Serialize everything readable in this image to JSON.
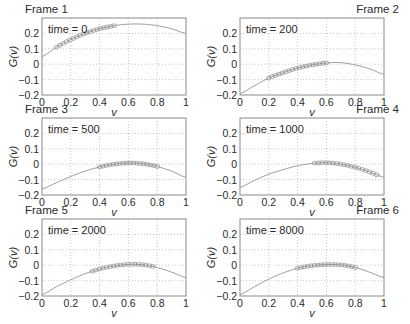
{
  "figure": {
    "title": "",
    "theme": {
      "text": "#2a2a2a",
      "box": "#8a8a8a",
      "grid": "#b8b8b8",
      "curve": "#9a9a9a",
      "marker": "#8a8a8a"
    }
  },
  "chart_data": [
    {
      "type": "line",
      "frame_label": "Frame 1",
      "frame_label_align": "left",
      "annotation": "time = 0",
      "xlabel": "v",
      "ylabel": "G(v)",
      "xlim": [
        0,
        1
      ],
      "ylim": [
        -0.2,
        0.3
      ],
      "xticks": [
        "0",
        "0.2",
        "0.4",
        "0.6",
        "0.8",
        "1"
      ],
      "yticks": [
        "0.2",
        "0.1",
        "0",
        "−0.1",
        "−0.2"
      ],
      "grid": true,
      "x": [
        0,
        0.1,
        0.2,
        0.3,
        0.4,
        0.5,
        0.6,
        0.7,
        0.8,
        0.9,
        1.0
      ],
      "series": [
        {
          "name": "G(v)",
          "values": [
            0.05,
            0.11,
            0.16,
            0.2,
            0.23,
            0.25,
            0.26,
            0.26,
            0.25,
            0.23,
            0.2
          ]
        }
      ],
      "markers": {
        "shape": "open-circle",
        "v_start": 0.1,
        "v_end": 0.5,
        "count": 18
      }
    },
    {
      "type": "line",
      "frame_label": "Frame 2",
      "frame_label_align": "right",
      "annotation": "time = 200",
      "xlabel": "v",
      "ylabel": "G(v)",
      "xlim": [
        0,
        1
      ],
      "ylim": [
        -0.2,
        0.3
      ],
      "xticks": [
        "0",
        "0.2",
        "0.4",
        "0.6",
        "0.8",
        "1"
      ],
      "yticks": [
        "0.2",
        "0.1",
        "0",
        "−0.1",
        "−0.2"
      ],
      "grid": true,
      "x": [
        0,
        0.1,
        0.2,
        0.3,
        0.4,
        0.5,
        0.6,
        0.7,
        0.8,
        0.9,
        1.0
      ],
      "series": [
        {
          "name": "G(v)",
          "values": [
            -0.19,
            -0.14,
            -0.09,
            -0.055,
            -0.025,
            -0.005,
            0.008,
            0.01,
            -0.005,
            -0.03,
            -0.065
          ]
        }
      ],
      "markers": {
        "shape": "open-circle",
        "v_start": 0.2,
        "v_end": 0.6,
        "count": 18
      }
    },
    {
      "type": "line",
      "frame_label": "Frame 3",
      "frame_label_align": "left",
      "annotation": "time = 500",
      "xlabel": "v",
      "ylabel": "G(v)",
      "xlim": [
        0,
        1
      ],
      "ylim": [
        -0.2,
        0.3
      ],
      "xticks": [
        "0",
        "0.2",
        "0.4",
        "0.6",
        "0.8",
        "1"
      ],
      "yticks": [
        "0.2",
        "0.1",
        "0",
        "−0.1",
        "−0.2"
      ],
      "grid": true,
      "x": [
        0,
        0.1,
        0.2,
        0.3,
        0.4,
        0.5,
        0.6,
        0.7,
        0.8,
        0.9,
        1.0
      ],
      "series": [
        {
          "name": "G(v)",
          "values": [
            -0.16,
            -0.12,
            -0.08,
            -0.045,
            -0.018,
            0.0,
            0.008,
            0.003,
            -0.015,
            -0.045,
            -0.085
          ]
        }
      ],
      "markers": {
        "shape": "open-circle",
        "v_start": 0.4,
        "v_end": 0.8,
        "count": 18
      }
    },
    {
      "type": "line",
      "frame_label": "Frame 4",
      "frame_label_align": "right",
      "annotation": "time = 1000",
      "xlabel": "v",
      "ylabel": "G(v)",
      "xlim": [
        0,
        1
      ],
      "ylim": [
        -0.2,
        0.3
      ],
      "xticks": [
        "0",
        "0.2",
        "0.4",
        "0.6",
        "0.8",
        "1"
      ],
      "yticks": [
        "0.2",
        "0.1",
        "0",
        "−0.1",
        "−0.2"
      ],
      "grid": true,
      "x": [
        0,
        0.1,
        0.2,
        0.3,
        0.4,
        0.5,
        0.6,
        0.7,
        0.8,
        0.9,
        1.0
      ],
      "series": [
        {
          "name": "G(v)",
          "values": [
            -0.15,
            -0.105,
            -0.065,
            -0.035,
            -0.01,
            0.005,
            0.01,
            0.0,
            -0.02,
            -0.05,
            -0.085
          ]
        }
      ],
      "markers": {
        "shape": "open-circle",
        "v_start": 0.52,
        "v_end": 0.95,
        "count": 18
      }
    },
    {
      "type": "line",
      "frame_label": "Frame 5",
      "frame_label_align": "left",
      "annotation": "time = 2000",
      "xlabel": "v",
      "ylabel": "G(v)",
      "xlim": [
        0,
        1
      ],
      "ylim": [
        -0.2,
        0.3
      ],
      "xticks": [
        "0",
        "0.2",
        "0.4",
        "0.6",
        "0.8",
        "1"
      ],
      "yticks": [
        "0.2",
        "0.1",
        "0",
        "−0.1",
        "−0.2"
      ],
      "grid": true,
      "x": [
        0,
        0.1,
        0.2,
        0.3,
        0.4,
        0.5,
        0.6,
        0.7,
        0.8,
        0.9,
        1.0
      ],
      "series": [
        {
          "name": "G(v)",
          "values": [
            -0.19,
            -0.14,
            -0.095,
            -0.055,
            -0.025,
            -0.005,
            0.005,
            0.003,
            -0.015,
            -0.045,
            -0.08
          ]
        }
      ],
      "markers": {
        "shape": "open-circle",
        "v_start": 0.35,
        "v_end": 0.77,
        "count": 18
      }
    },
    {
      "type": "line",
      "frame_label": "Frame 6",
      "frame_label_align": "right",
      "annotation": "time = 8000",
      "xlabel": "v",
      "ylabel": "G(v)",
      "xlim": [
        0,
        1
      ],
      "ylim": [
        -0.2,
        0.3
      ],
      "xticks": [
        "0",
        "0.2",
        "0.4",
        "0.6",
        "0.8",
        "1"
      ],
      "yticks": [
        "0.2",
        "0.1",
        "0",
        "−0.1",
        "−0.2"
      ],
      "grid": true,
      "x": [
        0,
        0.1,
        0.2,
        0.3,
        0.4,
        0.5,
        0.6,
        0.7,
        0.8,
        0.9,
        1.0
      ],
      "series": [
        {
          "name": "G(v)",
          "values": [
            -0.19,
            -0.14,
            -0.09,
            -0.05,
            -0.02,
            -0.003,
            0.004,
            0.002,
            -0.015,
            -0.045,
            -0.08
          ]
        }
      ],
      "markers": {
        "shape": "open-circle",
        "v_start": 0.4,
        "v_end": 0.8,
        "count": 18
      }
    }
  ]
}
